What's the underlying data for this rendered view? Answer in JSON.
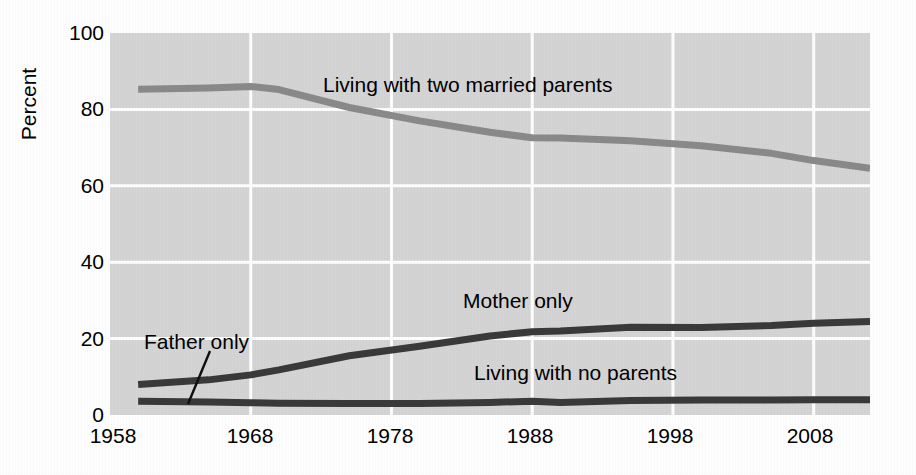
{
  "chart_data": {
    "type": "line",
    "title": "",
    "subtitle": "",
    "xlabel": "",
    "ylabel": "Percent",
    "xlim": [
      1958,
      2012
    ],
    "ylim": [
      0,
      100
    ],
    "xticks": [
      1958,
      1968,
      1978,
      1988,
      1998,
      2008
    ],
    "xtick_labels": [
      "1958",
      "1968",
      "1978",
      "1988",
      "1998",
      "2008"
    ],
    "yticks": [
      0,
      20,
      40,
      60,
      80,
      100
    ],
    "ytick_labels": [
      "0",
      "20",
      "40",
      "60",
      "80",
      "100"
    ],
    "grid": "white gridlines on gray plot background, both axes",
    "legend": "inline annotations next to each line",
    "plot_background": "#d5d5d5",
    "gridline_color": "#ffffff",
    "series": [
      {
        "name": "Living with two married parents",
        "color": "#8a8a8a",
        "label_position": "above-line-center-left",
        "x": [
          1960,
          1965,
          1968,
          1970,
          1975,
          1980,
          1985,
          1988,
          1990,
          1995,
          2000,
          2005,
          2008,
          2012
        ],
        "values": [
          85.3,
          85.6,
          86.0,
          85.2,
          80.5,
          77.0,
          74.0,
          72.6,
          72.5,
          71.8,
          70.5,
          68.5,
          66.6,
          64.6
        ]
      },
      {
        "name": "Mother only",
        "color": "#3a3a3a",
        "label_position": "above-line-center",
        "x": [
          1960,
          1965,
          1968,
          1970,
          1975,
          1980,
          1985,
          1988,
          1990,
          1995,
          2000,
          2005,
          2008,
          2012
        ],
        "values": [
          8.0,
          9.2,
          10.5,
          11.8,
          15.5,
          18.0,
          20.7,
          21.8,
          22.0,
          23.0,
          22.9,
          23.4,
          24.0,
          24.5
        ]
      },
      {
        "name": "Living with no parents",
        "color": "#3a3a3a",
        "label_position": "above-line-right",
        "x": [
          1960,
          1965,
          1968,
          1970,
          1975,
          1980,
          1985,
          1988,
          1990,
          1995,
          2000,
          2005,
          2008,
          2012
        ],
        "values": [
          3.6,
          3.4,
          3.2,
          3.1,
          3.0,
          3.0,
          3.3,
          3.6,
          3.3,
          3.8,
          3.9,
          3.9,
          4.0,
          4.0
        ]
      },
      {
        "name": "Father only",
        "color": "#3a3a3a",
        "label_position": "leader-line-to-lower-line",
        "x": [],
        "values": [],
        "note": "label with leader line pointing to the bottom-most band"
      }
    ],
    "annotations": [
      {
        "text": "Living with two married parents",
        "series": "Living with two married parents"
      },
      {
        "text": "Mother only",
        "series": "Mother only"
      },
      {
        "text": "Father only",
        "series": "Father only"
      },
      {
        "text": "Living with no parents",
        "series": "Living with no parents"
      }
    ]
  }
}
